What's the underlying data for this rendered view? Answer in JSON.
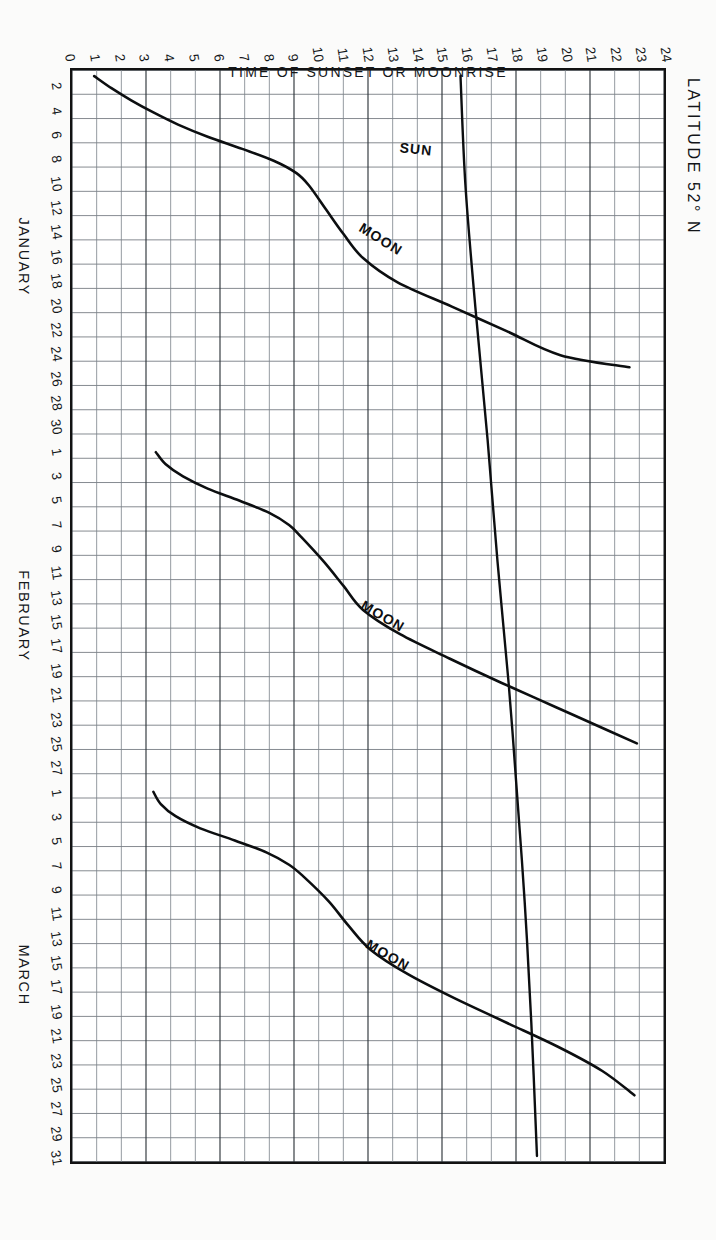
{
  "title": "LATITUDE 52° N",
  "title_degree_symbol": "°",
  "axes": {
    "y_axis_title": "TIME OF SUNSET OR MOONRISE",
    "y_ticks": [
      "24",
      "23",
      "22",
      "21",
      "20",
      "19",
      "18",
      "17",
      "16",
      "15",
      "14",
      "13",
      "12",
      "11",
      "10",
      "9",
      "8",
      "7",
      "6",
      "5",
      "4",
      "3",
      "2",
      "1",
      "0"
    ],
    "y_min": 0,
    "y_max": 24,
    "x_axis_title": "",
    "months": [
      {
        "name": "JANUARY",
        "days": 31,
        "tick_labels": [
          "2",
          "4",
          "6",
          "8",
          "10",
          "12",
          "14",
          "16",
          "18",
          "20",
          "22",
          "24",
          "26",
          "28",
          "30"
        ]
      },
      {
        "name": "FEBRUARY",
        "days": 28,
        "tick_labels": [
          "1",
          "3",
          "5",
          "7",
          "9",
          "11",
          "13",
          "15",
          "17",
          "19",
          "21",
          "23",
          "25",
          "27"
        ]
      },
      {
        "name": "MARCH",
        "days": 31,
        "tick_labels": [
          "1",
          "3",
          "5",
          "7",
          "9",
          "11",
          "13",
          "15",
          "17",
          "19",
          "21",
          "23",
          "25",
          "27",
          "29",
          "31"
        ]
      }
    ]
  },
  "series_labels": {
    "sun": "SUN",
    "moon": "MOON"
  },
  "chart_data": {
    "type": "line",
    "title": "LATITUDE 52° N",
    "xlabel": "JANUARY  FEBRUARY  MARCH",
    "ylabel": "TIME OF SUNSET OR MOONRISE",
    "ylim": [
      0,
      24
    ],
    "xlim": [
      1,
      90
    ],
    "grid": true,
    "legend": "inline-annotations",
    "x_tick_step_days": 2,
    "series": [
      {
        "name": "SUN",
        "note": "time of sunset, slowly rising through winter into spring",
        "x_days": [
          1,
          10,
          20,
          31,
          41,
          51,
          59,
          69,
          79,
          90
        ],
        "values": [
          15.75,
          15.95,
          16.35,
          16.85,
          17.25,
          17.7,
          18.0,
          18.35,
          18.62,
          18.85
        ]
      },
      {
        "name": "MOON (January cycle)",
        "note": "time of moonrise, resets each lunation",
        "x_days": [
          1,
          2,
          3,
          4,
          5,
          6,
          7,
          8,
          9,
          10,
          12,
          14,
          16,
          18,
          20,
          22,
          24,
          25
        ],
        "values": [
          0.9,
          1.6,
          2.4,
          3.3,
          4.3,
          5.5,
          6.9,
          8.2,
          9.1,
          9.6,
          10.3,
          11.0,
          11.8,
          13.2,
          15.4,
          17.6,
          19.8,
          22.6
        ]
      },
      {
        "name": "MOON (February cycle)",
        "note": "time of moonrise, resets each lunation",
        "x_days": [
          32,
          33,
          34,
          35,
          36,
          37,
          38,
          39,
          41,
          43,
          45,
          47,
          49,
          51,
          53,
          55,
          56
        ],
        "values": [
          3.4,
          3.8,
          4.5,
          5.5,
          6.8,
          8.0,
          8.8,
          9.3,
          10.2,
          11.0,
          11.8,
          13.3,
          15.3,
          17.4,
          19.6,
          21.8,
          22.9
        ]
      },
      {
        "name": "MOON (March cycle)",
        "note": "time of moonrise, resets each lunation",
        "x_days": [
          60,
          61,
          62,
          63,
          64,
          65,
          66,
          67,
          69,
          71,
          73,
          75,
          77,
          79,
          81,
          83,
          85
        ],
        "values": [
          3.3,
          3.6,
          4.2,
          5.2,
          6.6,
          7.9,
          8.8,
          9.4,
          10.4,
          11.2,
          12.1,
          13.6,
          15.5,
          17.6,
          19.7,
          21.5,
          22.8
        ]
      }
    ]
  },
  "colors": {
    "ink": "#121212",
    "grid_major": "#3a3f45",
    "grid_minor": "#8e959c",
    "paper": "#ffffff",
    "page_background": "#fbfbfa"
  }
}
